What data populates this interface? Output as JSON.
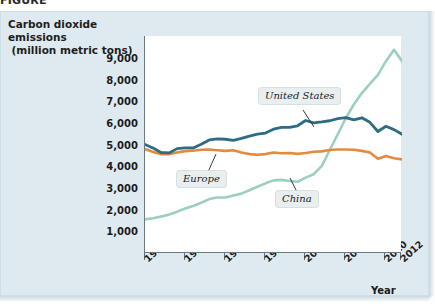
{
  "figure": {
    "top_clipped_caption": "FIGURE",
    "y_axis_title_line1": "Carbon dioxide emissions",
    "y_axis_title_line2": "(million metric tons)",
    "x_axis_title": "Year"
  },
  "colors": {
    "united_states": "#2d6c82",
    "europe": "#e58a3c",
    "china": "#9ccfc2",
    "panel_background": "#dfeaf0",
    "plot_background": "#ffffff",
    "axis": "#6b7a82",
    "callout_background": "#e9eeef"
  },
  "callouts": {
    "united_states": "United States",
    "europe": "Europe",
    "china": "China"
  },
  "chart_data": {
    "type": "line",
    "title": "",
    "xlabel": "Year",
    "ylabel": "Carbon dioxide emissions (million metric tons)",
    "xlim": [
      1980,
      2012
    ],
    "ylim": [
      0,
      9500
    ],
    "yticks": [
      1000,
      2000,
      3000,
      4000,
      5000,
      6000,
      7000,
      8000,
      9000
    ],
    "ytick_labels": [
      "1,000",
      "2,000",
      "3,000",
      "4,000",
      "5,000",
      "6,000",
      "7,000",
      "8,000",
      "9,000"
    ],
    "xticks": [
      1980,
      1985,
      1990,
      1995,
      2000,
      2005,
      2010,
      2012
    ],
    "xtick_labels": [
      "1980",
      "1985",
      "1990",
      "1995",
      "2000",
      "2005",
      "2010",
      "2012"
    ],
    "grid": false,
    "legend": "inline-callouts",
    "x": [
      1980,
      1981,
      1982,
      1983,
      1984,
      1985,
      1986,
      1987,
      1988,
      1989,
      1990,
      1991,
      1992,
      1993,
      1994,
      1995,
      1996,
      1997,
      1998,
      1999,
      2000,
      2001,
      2002,
      2003,
      2004,
      2005,
      2006,
      2007,
      2008,
      2009,
      2010,
      2011,
      2012
    ],
    "series": [
      {
        "name": "United States",
        "color": "#2d6c82",
        "values": [
          4750,
          4600,
          4400,
          4380,
          4570,
          4600,
          4600,
          4760,
          4950,
          5000,
          4980,
          4930,
          5020,
          5120,
          5200,
          5250,
          5420,
          5500,
          5500,
          5570,
          5800,
          5700,
          5740,
          5790,
          5880,
          5930,
          5830,
          5920,
          5720,
          5320,
          5550,
          5400,
          5200
        ]
      },
      {
        "name": "Europe",
        "color": "#e58a3c",
        "values": [
          4550,
          4420,
          4330,
          4330,
          4400,
          4460,
          4480,
          4520,
          4530,
          4500,
          4470,
          4500,
          4400,
          4330,
          4300,
          4330,
          4400,
          4370,
          4380,
          4340,
          4380,
          4430,
          4450,
          4510,
          4530,
          4530,
          4520,
          4470,
          4400,
          4130,
          4250,
          4150,
          4100
        ]
      },
      {
        "name": "China",
        "color": "#9ccfc2",
        "values": [
          1470,
          1520,
          1600,
          1680,
          1810,
          1950,
          2060,
          2200,
          2360,
          2430,
          2430,
          2520,
          2600,
          2750,
          2900,
          3050,
          3180,
          3200,
          3150,
          3120,
          3300,
          3450,
          3800,
          4500,
          5200,
          5900,
          6500,
          7000,
          7400,
          7800,
          8400,
          8900,
          8400
        ]
      }
    ]
  }
}
